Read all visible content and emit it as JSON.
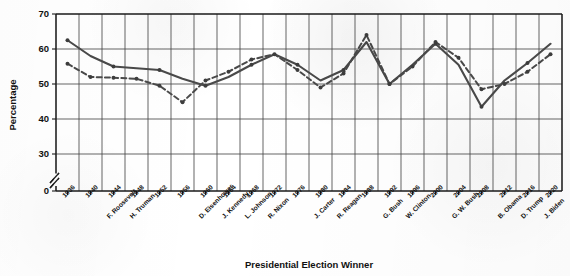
{
  "chart_data": {
    "type": "line",
    "title": "",
    "xlabel": "Presidential Election Winner",
    "ylabel": "Percentage",
    "ylim": [
      30,
      70
    ],
    "yticks": [
      0,
      30,
      40,
      50,
      60,
      70
    ],
    "y_axis_break": true,
    "grid": true,
    "legend": "none",
    "categories": [
      "1936",
      "1940",
      "1944",
      "1948",
      "1952",
      "1956",
      "1960",
      "1964",
      "1968",
      "1972",
      "1976",
      "1980",
      "1984",
      "1988",
      "1992",
      "1996",
      "2000",
      "2004",
      "2008",
      "2012",
      "2016",
      "2020"
    ],
    "winners": [
      "F. Roosevelt",
      "",
      "",
      "H. Truman",
      "D. Eisenhower",
      "",
      "J. Kennedy",
      "L. Johnson",
      "R. Nixon",
      "",
      "J. Carter",
      "R. Reagan",
      "",
      "G. Bush",
      "W. Clinton",
      "",
      "G. W. Bush",
      "",
      "B. Obama",
      "",
      "D. Trump",
      "J. Biden"
    ],
    "winner_label_positions": [
      {
        "year": "1944",
        "label": "F. Roosevelt"
      },
      {
        "year": "1948",
        "label": "H. Truman"
      },
      {
        "year": "1960",
        "label": "D. Eisenhower"
      },
      {
        "year": "1964",
        "label": "J. Kennedy"
      },
      {
        "year": "1968",
        "label": "L. Johnson"
      },
      {
        "year": "1972",
        "label": "R. Nixon"
      },
      {
        "year": "1980",
        "label": "J. Carter"
      },
      {
        "year": "1984",
        "label": "R. Reagan"
      },
      {
        "year": "1992",
        "label": "G. Bush"
      },
      {
        "year": "1996",
        "label": "W. Clinton"
      },
      {
        "year": "2004",
        "label": "G. W. Bush"
      },
      {
        "year": "2012",
        "label": "B. Obama"
      },
      {
        "year": "2016",
        "label": "D. Trump"
      },
      {
        "year": "2020",
        "label": "J. Biden"
      }
    ],
    "series": [
      {
        "name": "solid",
        "style": "solid",
        "values": [
          62.5,
          58.0,
          55.0,
          54.5,
          54.0,
          51.5,
          49.5,
          52.0,
          55.5,
          58.5,
          55.5,
          51.0,
          54.0,
          62.0,
          50.0,
          55.5,
          61.5,
          55.5,
          43.5,
          51.0,
          56.0,
          61.5
        ]
      },
      {
        "name": "dashed",
        "style": "dashed",
        "values": [
          55.8,
          52.0,
          51.8,
          51.5,
          49.5,
          44.8,
          51.0,
          53.5,
          57.0,
          58.5,
          54.0,
          49.0,
          53.0,
          64.0,
          50.0,
          55.0,
          62.0,
          57.5,
          48.5,
          50.0,
          53.5,
          58.5
        ]
      }
    ],
    "series_full": {
      "solid": [
        {
          "year": "1936",
          "value": 62.5
        },
        {
          "year": "1940",
          "value": 55.0
        },
        {
          "year": "1944",
          "value": 54.0
        },
        {
          "year": "1948",
          "value": 51.5
        },
        {
          "year": "1952",
          "value": 49.5
        },
        {
          "year": "1956",
          "value": 55.5
        },
        {
          "year": "1960",
          "value": 56.5
        },
        {
          "year": "1964",
          "value": 58.5
        },
        {
          "year": "1968",
          "value": 54.0
        },
        {
          "year": "1972",
          "value": 55.0
        },
        {
          "year": "1976",
          "value": 50.0
        },
        {
          "year": "1980",
          "value": 61.5
        },
        {
          "year": "1984",
          "value": 50.0
        },
        {
          "year": "1988",
          "value": 50.5
        },
        {
          "year": "1992",
          "value": 50.5
        },
        {
          "year": "1996",
          "value": 53.5
        },
        {
          "year": "2000",
          "value": 61.5
        },
        {
          "year": "2004",
          "value": 43.5
        },
        {
          "year": "2008",
          "value": 49.5
        },
        {
          "year": "2012",
          "value": 51.5
        },
        {
          "year": "2016",
          "value": 49.0
        },
        {
          "year": "2020",
          "value": 49.0
        }
      ]
    },
    "annotations": []
  },
  "accessibility": {
    "description": "Scanned line chart with two overlapping series, one solid and one dashed, showing percentage by presidential election winner from 1936 to 2020."
  },
  "colors": {
    "line": "#4a4a4a",
    "marker": "#3d3d3d",
    "grid": "#4a4a4a",
    "axis": "#1a1a1a",
    "background": "#ffffff"
  }
}
